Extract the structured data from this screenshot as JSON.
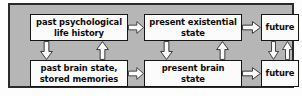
{
  "diagram": {
    "background_color": "#b6b6b6",
    "frame_color": "#2a2a2a",
    "node_fill": "#fbfbfb",
    "node_stroke": "#161616",
    "arrow_fill": "#fcfcfc",
    "arrow_stroke": "#141414",
    "nodes": [
      {
        "id": "past-psych",
        "label": "past psychological\nlife history",
        "row": "top",
        "column": "past"
      },
      {
        "id": "present-exist",
        "label": "present existential\nstate",
        "row": "top",
        "column": "present"
      },
      {
        "id": "future-top",
        "label": "future",
        "row": "top",
        "column": "future"
      },
      {
        "id": "past-brain",
        "label": "past brain state,\nstored memories",
        "row": "bottom",
        "column": "past"
      },
      {
        "id": "present-brain",
        "label": "present brain\nstate",
        "row": "bottom",
        "column": "present"
      },
      {
        "id": "future-bot",
        "label": "future",
        "row": "bottom",
        "column": "future"
      }
    ],
    "arrows": [
      {
        "id": "h-top-1",
        "from": "past-psych",
        "to": "present-exist",
        "direction": "right"
      },
      {
        "id": "h-top-2",
        "from": "present-exist",
        "to": "future-top",
        "direction": "right"
      },
      {
        "id": "h-bot-1",
        "from": "past-brain",
        "to": "present-brain",
        "direction": "right"
      },
      {
        "id": "h-bot-2",
        "from": "present-brain",
        "to": "future-bot",
        "direction": "right"
      },
      {
        "id": "v-l-down",
        "from": "past-psych",
        "to": "past-brain",
        "direction": "down"
      },
      {
        "id": "v-l-up",
        "from": "past-brain",
        "to": "past-psych",
        "direction": "up"
      },
      {
        "id": "v-m-down",
        "from": "present-exist",
        "to": "present-brain",
        "direction": "down"
      },
      {
        "id": "v-m-up",
        "from": "present-brain",
        "to": "present-exist",
        "direction": "up"
      },
      {
        "id": "v-r-down",
        "from": "future-top",
        "to": "future-bot",
        "direction": "down"
      },
      {
        "id": "v-r-up",
        "from": "future-bot",
        "to": "future-top",
        "direction": "up"
      }
    ]
  }
}
